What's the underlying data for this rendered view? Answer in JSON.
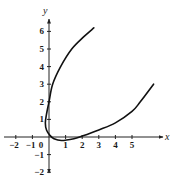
{
  "chart_data": {
    "type": "line",
    "title": "",
    "xlabel": "x",
    "ylabel": "y",
    "xlim": [
      -2.5,
      7
    ],
    "ylim": [
      -2.2,
      6.8
    ],
    "x_ticks": [
      -2,
      -1,
      0,
      1,
      2,
      3,
      4,
      5
    ],
    "y_ticks": [
      -2,
      -1,
      1,
      2,
      3,
      4,
      5,
      6
    ],
    "grid": false,
    "legend": null,
    "colors": {
      "axis": "#222222",
      "curve": "#111111"
    },
    "series": [
      {
        "name": "curve",
        "points": [
          [
            6.3,
            3.0
          ],
          [
            5.5,
            2.0
          ],
          [
            5.0,
            1.45
          ],
          [
            4.0,
            0.8
          ],
          [
            3.0,
            0.4
          ],
          [
            2.0,
            0.05
          ],
          [
            1.5,
            -0.1
          ],
          [
            0.75,
            -0.2
          ],
          [
            0.3,
            -0.1
          ],
          [
            0.05,
            0.1
          ],
          [
            -0.15,
            0.4
          ],
          [
            -0.22,
            0.8
          ],
          [
            -0.15,
            1.3
          ],
          [
            0.0,
            2.0
          ],
          [
            0.22,
            3.0
          ],
          [
            0.7,
            4.0
          ],
          [
            1.37,
            5.0
          ],
          [
            2.1,
            5.7
          ],
          [
            2.7,
            6.2
          ]
        ]
      }
    ]
  }
}
